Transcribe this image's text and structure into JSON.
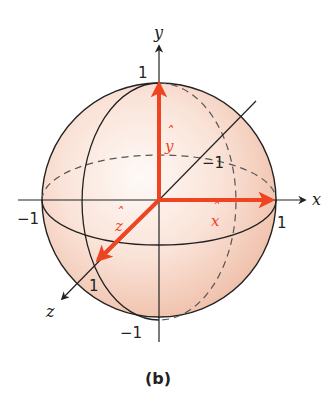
{
  "figure": {
    "caption": "(b)",
    "colors": {
      "vector": "#ee4422",
      "axis": "#222222",
      "sphere_fill_edge": "#f3cbb8",
      "sphere_fill_center": "#fdf3ee"
    },
    "axes": {
      "x": {
        "label": "x",
        "pos_tick": "1",
        "neg_tick": "−1"
      },
      "y": {
        "label": "y",
        "pos_tick": "1",
        "neg_tick": "−1"
      },
      "z": {
        "label": "z",
        "pos_tick": "1",
        "neg_tick": "−1"
      }
    },
    "unit_vectors": {
      "x_hat": {
        "letter": "x",
        "hat": "ˆ"
      },
      "y_hat": {
        "letter": "y",
        "hat": "ˆ"
      },
      "z_hat": {
        "letter": "z",
        "hat": "ˆ"
      }
    }
  }
}
